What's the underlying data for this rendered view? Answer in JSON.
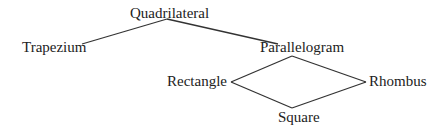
{
  "diagram": {
    "nodes": {
      "quadrilateral": "Quadrilateral",
      "trapezium": "Trapezium",
      "parallelogram": "Parallelogram",
      "rectangle": "Rectangle",
      "rhombus": "Rhombus",
      "square": "Square"
    },
    "edges": [
      [
        "Quadrilateral",
        "Trapezium"
      ],
      [
        "Quadrilateral",
        "Parallelogram"
      ],
      [
        "Parallelogram",
        "Rectangle"
      ],
      [
        "Parallelogram",
        "Rhombus"
      ],
      [
        "Rectangle",
        "Square"
      ],
      [
        "Rhombus",
        "Square"
      ]
    ],
    "line_color": "#333333",
    "text_color": "#222222"
  }
}
